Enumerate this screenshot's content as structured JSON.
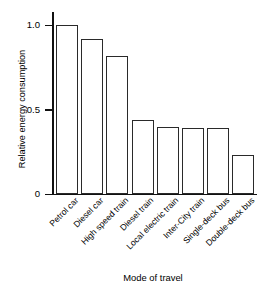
{
  "chart_data": {
    "type": "bar",
    "title": "",
    "xlabel": "Mode of travel",
    "ylabel": "Relative energy consumption",
    "categories": [
      "Petrol car",
      "Diesel car",
      "High speed train",
      "Diesel train",
      "Local electric train",
      "Inter-City train",
      "Single-deck bus",
      "Double-deck bus"
    ],
    "values": [
      1.0,
      0.92,
      0.82,
      0.44,
      0.4,
      0.39,
      0.39,
      0.23
    ],
    "ylim": [
      0,
      1.08
    ],
    "yticks": [
      0,
      0.5,
      1.0
    ],
    "ytick_labels": [
      "0",
      "0.5",
      "1.0"
    ],
    "grid": false,
    "legend": null,
    "bar_fill": "#ffffff",
    "bar_edge": "#2a2a2a",
    "axis_color": "#111111"
  }
}
